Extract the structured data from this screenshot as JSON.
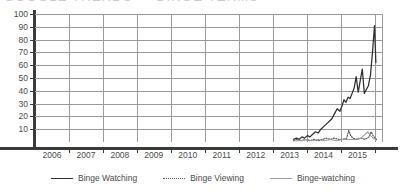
{
  "title_sliver": "GOOGLE TRENDS  —  BINGE TERMS",
  "chart_data": {
    "type": "line",
    "title": "",
    "xlabel": "",
    "ylabel": "",
    "xlim": [
      2005.0,
      2015.25
    ],
    "ylim": [
      0,
      100
    ],
    "grid": true,
    "legend_position": "bottom-center",
    "y_ticks": [
      10,
      20,
      30,
      40,
      50,
      60,
      70,
      80,
      90,
      100
    ],
    "x_ticks": [
      "2006",
      "2007",
      "2008",
      "2009",
      "2010",
      "2011",
      "2012",
      "2013",
      "2014",
      "2015"
    ],
    "colors": {
      "binge_watching": "#2f2f2f",
      "binge_viewing": "#5d5d5d",
      "binge_watching_hyphen": "#9e9e9e",
      "axis": "#3a3a3a",
      "grid": "#9a9a9a",
      "background": "#ffffff"
    },
    "series": [
      {
        "name": "Binge Watching",
        "style": "solid",
        "color": "#2f2f2f",
        "x": [
          2012.62,
          2012.7,
          2012.78,
          2012.86,
          2012.94,
          2013.02,
          2013.1,
          2013.18,
          2013.26,
          2013.34,
          2013.42,
          2013.5,
          2013.58,
          2013.66,
          2013.74,
          2013.82,
          2013.9,
          2013.98,
          2014.04,
          2014.1,
          2014.16,
          2014.22,
          2014.28,
          2014.34,
          2014.4,
          2014.46,
          2014.52,
          2014.58,
          2014.64,
          2014.7,
          2014.76,
          2014.82,
          2014.88,
          2014.94,
          2015.0,
          2015.04
        ],
        "values": [
          2,
          3,
          2,
          4,
          3,
          5,
          4,
          6,
          8,
          7,
          10,
          12,
          14,
          16,
          18,
          22,
          26,
          24,
          28,
          33,
          31,
          35,
          34,
          38,
          42,
          51,
          39,
          48,
          57,
          38,
          41,
          44,
          52,
          70,
          91,
          62
        ]
      },
      {
        "name": "Binge Viewing",
        "style": "dotted",
        "color": "#5d5d5d",
        "x": [
          2012.62,
          2012.74,
          2012.86,
          2012.98,
          2013.1,
          2013.22,
          2013.34,
          2013.46,
          2013.58,
          2013.7,
          2013.82,
          2013.94,
          2014.06,
          2014.18,
          2014.24,
          2014.3,
          2014.36,
          2014.48,
          2014.6,
          2014.72,
          2014.84,
          2014.9,
          2014.96,
          2015.02,
          2015.06
        ],
        "values": [
          1,
          2,
          1,
          2,
          1,
          2,
          1,
          2,
          3,
          2,
          3,
          2,
          2,
          3,
          9,
          5,
          3,
          2,
          3,
          2,
          4,
          8,
          5,
          3,
          2
        ]
      },
      {
        "name": "Binge-watching",
        "style": "solid",
        "color": "#9e9e9e",
        "x": [
          2012.62,
          2012.8,
          2012.98,
          2013.16,
          2013.34,
          2013.52,
          2013.7,
          2013.88,
          2014.06,
          2014.24,
          2014.42,
          2014.6,
          2014.72,
          2014.8,
          2014.88,
          2014.96,
          2015.04
        ],
        "values": [
          1,
          1,
          2,
          1,
          2,
          1,
          2,
          1,
          2,
          2,
          2,
          3,
          6,
          8,
          5,
          3,
          2
        ]
      }
    ]
  },
  "legend": {
    "items": [
      {
        "label": "Binge Watching",
        "style": "solid-dark"
      },
      {
        "label": "Binge Viewing",
        "style": "dotted"
      },
      {
        "label": "Binge-watching",
        "style": "solid-light"
      }
    ]
  }
}
